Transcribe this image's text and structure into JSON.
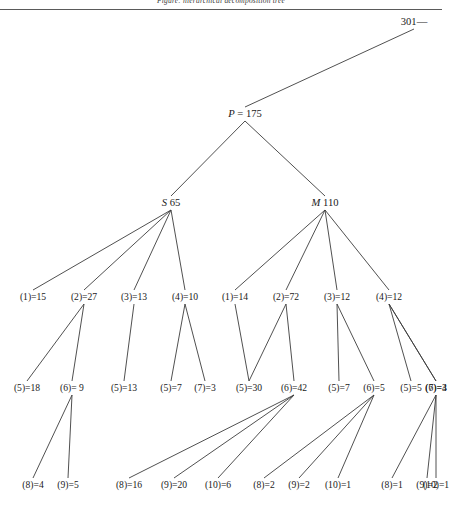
{
  "header": {
    "running_head": "Figure: hierarchical decomposition tree"
  },
  "figure": {
    "type": "tree-diagram",
    "root_label": "301—",
    "nodes": [
      {
        "id": "root",
        "label": "301—",
        "x": 414,
        "y": 22,
        "level": 0
      },
      {
        "id": "P",
        "label": "P = 175",
        "italic_prefix": "P",
        "x": 245,
        "y": 114,
        "level": 1
      },
      {
        "id": "S",
        "label": "S 65",
        "italic_prefix": "S",
        "x": 171,
        "y": 203,
        "level": 2
      },
      {
        "id": "M",
        "label": "M 110",
        "italic_prefix": "M",
        "x": 325,
        "y": 203,
        "level": 2
      },
      {
        "id": "L3a",
        "label": "(1)=15",
        "x": 33,
        "y": 297,
        "level": 3
      },
      {
        "id": "L3b",
        "label": "(2)=27",
        "x": 84,
        "y": 297,
        "level": 3
      },
      {
        "id": "L3c",
        "label": "(3)=13",
        "x": 134,
        "y": 297,
        "level": 3
      },
      {
        "id": "L3d",
        "label": "(4)=10",
        "x": 185,
        "y": 297,
        "level": 3
      },
      {
        "id": "R3a",
        "label": "(1)=14",
        "x": 235,
        "y": 297,
        "level": 3
      },
      {
        "id": "R3b",
        "label": "(2)=72",
        "x": 286,
        "y": 297,
        "level": 3
      },
      {
        "id": "R3c",
        "label": "(3)=12",
        "x": 337,
        "y": 297,
        "level": 3
      },
      {
        "id": "R3d",
        "label": "(4)=12",
        "x": 389,
        "y": 297,
        "level": 3
      },
      {
        "id": "L4a",
        "label": "(5)=18",
        "x": 27,
        "y": 388,
        "level": 4
      },
      {
        "id": "L4b",
        "label": "(6)= 9",
        "x": 72,
        "y": 388,
        "level": 4
      },
      {
        "id": "L4c",
        "label": "(5)=13",
        "x": 124,
        "y": 388,
        "level": 4
      },
      {
        "id": "L4d",
        "label": "(5)=7",
        "x": 171,
        "y": 388,
        "level": 4
      },
      {
        "id": "L4e",
        "label": "(7)=3",
        "x": 205,
        "y": 388,
        "level": 4
      },
      {
        "id": "R4a",
        "label": "(5)=30",
        "x": 249,
        "y": 388,
        "level": 4
      },
      {
        "id": "R4b",
        "label": "(6)=42",
        "x": 294,
        "y": 388,
        "level": 4
      },
      {
        "id": "R4c",
        "label": "(5)=7",
        "x": 339,
        "y": 388,
        "level": 4
      },
      {
        "id": "R4d",
        "label": "(6)=5",
        "x": 374,
        "y": 388,
        "level": 4
      },
      {
        "id": "R4e",
        "label": "(5)=5",
        "x": 411,
        "y": 388,
        "level": 4
      },
      {
        "id": "R4f",
        "label": "(6)=4",
        "x": 445,
        "y": 388,
        "level": 4
      },
      {
        "id": "R4g",
        "label": "(7)=3",
        "x": 479,
        "y": 388,
        "level": 4
      },
      {
        "id": "L5a",
        "label": "(8)=4",
        "x": 33,
        "y": 485,
        "level": 5
      },
      {
        "id": "L5b",
        "label": "(9)=5",
        "x": 68,
        "y": 485,
        "level": 5
      },
      {
        "id": "L5c",
        "label": "(8)=16",
        "x": 129,
        "y": 485,
        "level": 5
      },
      {
        "id": "L5d",
        "label": "(9)=20",
        "x": 174,
        "y": 485,
        "level": 5
      },
      {
        "id": "L5e",
        "label": "(10)=6",
        "x": 218,
        "y": 485,
        "level": 5
      },
      {
        "id": "R5a",
        "label": "(8)=2",
        "x": 264,
        "y": 485,
        "level": 5
      },
      {
        "id": "R5b",
        "label": "(9)=2",
        "x": 299,
        "y": 485,
        "level": 5
      },
      {
        "id": "R5c",
        "label": "(10)=1",
        "x": 338,
        "y": 485,
        "level": 5
      },
      {
        "id": "R5d",
        "label": "(8)=1",
        "x": 392,
        "y": 485,
        "level": 5
      },
      {
        "id": "R5e",
        "label": "(9)=2",
        "x": 427,
        "y": 485,
        "level": 5
      },
      {
        "id": "R5f",
        "label": "(10)=1",
        "x": 466,
        "y": 485,
        "level": 5
      }
    ],
    "edges": [
      {
        "from": "root",
        "to": "P"
      },
      {
        "from": "P",
        "to": "S"
      },
      {
        "from": "P",
        "to": "M"
      },
      {
        "from": "S",
        "to": "L3a"
      },
      {
        "from": "S",
        "to": "L3b"
      },
      {
        "from": "S",
        "to": "L3c"
      },
      {
        "from": "S",
        "to": "L3d"
      },
      {
        "from": "M",
        "to": "R3a"
      },
      {
        "from": "M",
        "to": "R3b"
      },
      {
        "from": "M",
        "to": "R3c"
      },
      {
        "from": "M",
        "to": "R3d"
      },
      {
        "from": "L3b",
        "to": "L4a"
      },
      {
        "from": "L3b",
        "to": "L4b"
      },
      {
        "from": "L3c",
        "to": "L4c"
      },
      {
        "from": "L3d",
        "to": "L4d"
      },
      {
        "from": "L3d",
        "to": "L4e"
      },
      {
        "from": "R3a",
        "to": "R4a"
      },
      {
        "from": "R3b",
        "to": "R4a"
      },
      {
        "from": "R3b",
        "to": "R4b"
      },
      {
        "from": "R3c",
        "to": "R4c"
      },
      {
        "from": "R3c",
        "to": "R4d"
      },
      {
        "from": "R3d",
        "to": "R4e"
      },
      {
        "from": "R3d",
        "to": "R4f"
      },
      {
        "from": "R3d",
        "to": "R4g"
      },
      {
        "from": "L4b",
        "to": "L5a"
      },
      {
        "from": "L4b",
        "to": "L5b"
      },
      {
        "from": "R4b",
        "to": "L5c"
      },
      {
        "from": "R4b",
        "to": "L5d"
      },
      {
        "from": "R4b",
        "to": "L5e"
      },
      {
        "from": "R4d",
        "to": "R5a"
      },
      {
        "from": "R4d",
        "to": "R5b"
      },
      {
        "from": "R4d",
        "to": "R5c"
      },
      {
        "from": "R4f",
        "to": "R5d"
      },
      {
        "from": "R4f",
        "to": "R5e"
      },
      {
        "from": "R4f",
        "to": "R5f"
      }
    ],
    "line_color": "#3c3c3c"
  }
}
